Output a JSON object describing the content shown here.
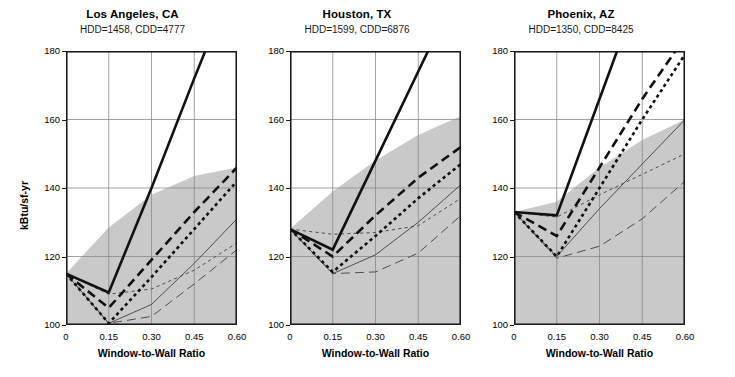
{
  "figure": {
    "ylabel": "kBtu/sf-yr",
    "xlabel": "Window-to-Wall Ratio",
    "xticks": [
      "0",
      "0.15",
      "0.30",
      "0.45",
      "0.60"
    ],
    "yticks": [
      "100",
      "120",
      "140",
      "160",
      "180"
    ],
    "colors": {
      "band_fill": "#c9c9c9",
      "grid": "#8a8a8a",
      "axis": "#1a1a1a",
      "series_dark": "#111111",
      "series_light": "#4d4d4d",
      "background": "#ffffff"
    }
  },
  "chart_data": [
    {
      "type": "line",
      "title": "Los Angeles, CA",
      "subtitle": "HDD=1458, CDD=4777",
      "hdd": 1458,
      "cdd": 4777,
      "xlabel": "Window-to-Wall Ratio",
      "ylabel": "kBtu/sf-yr",
      "xlim": [
        0,
        0.6
      ],
      "ylim": [
        100,
        180
      ],
      "xticks": [
        0,
        0.15,
        0.3,
        0.45,
        0.6
      ],
      "yticks": [
        100,
        120,
        140,
        160,
        180
      ],
      "grid": true,
      "legend": "none",
      "x": [
        0,
        0.15,
        0.3,
        0.45,
        0.6
      ],
      "band": {
        "name": "shaded-range-band",
        "upper": [
          115,
          128.5,
          138,
          143.5,
          146
        ],
        "lower": [
          100,
          100,
          100,
          100,
          100
        ]
      },
      "series": [
        {
          "name": "series-1",
          "style": "thick-solid",
          "values": [
            115,
            109.5,
            140,
            172,
            203
          ]
        },
        {
          "name": "series-2",
          "style": "thick-long-dash",
          "values": [
            115,
            105,
            119,
            133,
            146
          ]
        },
        {
          "name": "series-3",
          "style": "thick-short-dash",
          "values": [
            115,
            100.5,
            114,
            128,
            142
          ]
        },
        {
          "name": "series-4",
          "style": "thin-solid",
          "values": [
            115,
            100.5,
            106,
            118,
            131
          ]
        },
        {
          "name": "series-5",
          "style": "thin-short-dash",
          "values": [
            115,
            109,
            110.5,
            116,
            124
          ]
        },
        {
          "name": "series-6",
          "style": "thin-long-dash",
          "values": [
            115,
            100.5,
            102.5,
            112,
            122
          ]
        }
      ]
    },
    {
      "type": "line",
      "title": "Houston, TX",
      "subtitle": "HDD=1599, CDD=6876",
      "hdd": 1599,
      "cdd": 6876,
      "xlabel": "Window-to-Wall Ratio",
      "ylabel": "kBtu/sf-yr",
      "xlim": [
        0,
        0.6
      ],
      "ylim": [
        100,
        180
      ],
      "xticks": [
        0,
        0.15,
        0.3,
        0.45,
        0.6
      ],
      "yticks": [
        100,
        120,
        140,
        160,
        180
      ],
      "grid": true,
      "legend": "none",
      "x": [
        0,
        0.15,
        0.3,
        0.45,
        0.6
      ],
      "band": {
        "name": "shaded-range-band",
        "upper": [
          128,
          139,
          148,
          155.5,
          161
        ],
        "lower": [
          100,
          100,
          100,
          100,
          100
        ]
      },
      "series": [
        {
          "name": "series-1",
          "style": "thick-solid",
          "values": [
            128,
            122,
            148,
            174,
            200
          ]
        },
        {
          "name": "series-2",
          "style": "thick-long-dash",
          "values": [
            128,
            120,
            132,
            143,
            152
          ]
        },
        {
          "name": "series-3",
          "style": "thick-short-dash",
          "values": [
            128,
            115.5,
            126,
            137,
            147
          ]
        },
        {
          "name": "series-4",
          "style": "thin-solid",
          "values": [
            128,
            115,
            120.5,
            130,
            141
          ]
        },
        {
          "name": "series-5",
          "style": "thin-short-dash",
          "values": [
            128,
            126.5,
            127,
            129,
            137
          ]
        },
        {
          "name": "series-6",
          "style": "thin-long-dash",
          "values": [
            128,
            115,
            115.5,
            121,
            132
          ]
        }
      ]
    },
    {
      "type": "line",
      "title": "Phoenix, AZ",
      "subtitle": "HDD=1350, CDD=8425",
      "hdd": 1350,
      "cdd": 8425,
      "xlabel": "Window-to-Wall Ratio",
      "ylabel": "kBtu/sf-yr",
      "xlim": [
        0,
        0.6
      ],
      "ylim": [
        100,
        180
      ],
      "xticks": [
        0,
        0.15,
        0.3,
        0.45,
        0.6
      ],
      "yticks": [
        100,
        120,
        140,
        160,
        180
      ],
      "grid": true,
      "legend": "none",
      "x": [
        0,
        0.15,
        0.3,
        0.45,
        0.6
      ],
      "band": {
        "name": "shaded-range-band",
        "upper": [
          133,
          136,
          146,
          154,
          160
        ],
        "lower": [
          100,
          100,
          100,
          100,
          100
        ]
      },
      "series": [
        {
          "name": "series-1",
          "style": "thick-solid",
          "values": [
            133,
            132,
            166,
            200,
            234
          ]
        },
        {
          "name": "series-2",
          "style": "thick-long-dash",
          "values": [
            133,
            126,
            146,
            166,
            184
          ]
        },
        {
          "name": "series-3",
          "style": "thick-short-dash",
          "values": [
            133,
            120,
            140,
            160,
            179
          ]
        },
        {
          "name": "series-4",
          "style": "thin-solid",
          "values": [
            133,
            120,
            134,
            147,
            160
          ]
        },
        {
          "name": "series-5",
          "style": "thin-short-dash",
          "values": [
            133,
            131.5,
            138,
            144,
            150
          ]
        },
        {
          "name": "series-6",
          "style": "thin-long-dash",
          "values": [
            133,
            119.5,
            123,
            131,
            142
          ]
        }
      ]
    }
  ]
}
